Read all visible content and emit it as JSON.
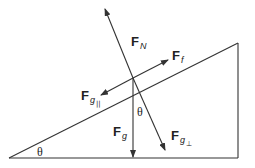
{
  "diagram": {
    "angle_label": "θ",
    "forces": [
      {
        "id": "normal",
        "main": "F",
        "sub": "N",
        "subsub": ""
      },
      {
        "id": "friction",
        "main": "F",
        "sub": "f",
        "subsub": ""
      },
      {
        "id": "gravity_parallel",
        "main": "F",
        "sub": "g",
        "subsub": "||"
      },
      {
        "id": "gravity",
        "main": "F",
        "sub": "g",
        "subsub": ""
      },
      {
        "id": "gravity_perpendicular",
        "main": "F",
        "sub": "g",
        "subsub": "⊥"
      }
    ],
    "colors": {
      "line": "#333333",
      "text": "#222222",
      "background": "#ffffff"
    }
  }
}
